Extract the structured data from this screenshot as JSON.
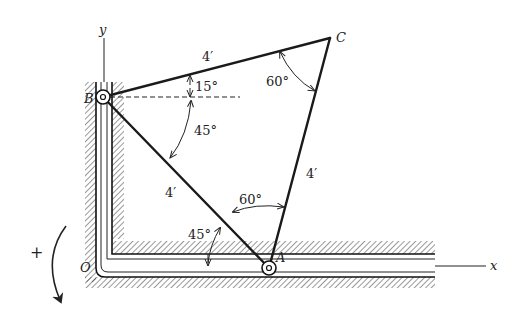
{
  "diagram": {
    "points": {
      "B": {
        "label": "B",
        "x": 103,
        "y": 97
      },
      "C": {
        "label": "C",
        "x": 330,
        "y": 38
      },
      "A": {
        "label": "A",
        "x": 269,
        "y": 268
      },
      "O": {
        "label": "O",
        "x": 108,
        "y": 268
      }
    },
    "axes": {
      "x_label": "x",
      "y_label": "y"
    },
    "lengths": {
      "BC": "4′",
      "CA": "4′",
      "BA": "4′"
    },
    "angles": {
      "B_above_horizontal": "15°",
      "C_interior": "60°",
      "B_between_BA_BC": "45°",
      "A_interior": "60°",
      "A_with_horizontal": "45°"
    },
    "rotation_sign": "+",
    "colors": {
      "ink": "#1a1a1a",
      "background": "#ffffff"
    }
  }
}
